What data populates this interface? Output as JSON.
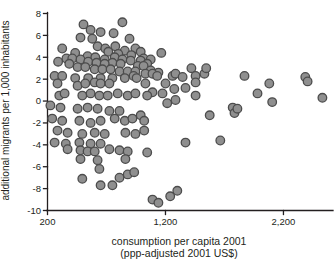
{
  "figure": {
    "background": "#ffffff",
    "axis_color": "#231f20",
    "text_color": "#231f20"
  },
  "chart_data": {
    "type": "scatter",
    "title": "",
    "xlabel": "consumption per capita 2001",
    "xlabel_line2": "(ppp-adjusted 2001 US$)",
    "ylabel": "additional migrants per 1,000 inhabitants",
    "xlim": [
      200,
      2620
    ],
    "ylim": [
      -10,
      8
    ],
    "grid": false,
    "legend": null,
    "xticks": {
      "values": [
        200,
        1200,
        2200
      ],
      "labels": [
        "200",
        "1,200",
        "2,200"
      ]
    },
    "yticks": {
      "values": [
        8,
        6,
        4,
        2,
        0,
        -2,
        -4,
        -6,
        -8,
        -10
      ],
      "labels": [
        "8",
        "6",
        "4",
        "2",
        "0",
        "-2",
        "-4",
        "-6",
        "-8",
        "-10"
      ]
    },
    "marker": {
      "fill": "#8f8f8f",
      "stroke": "#4c4c4c",
      "radius_px": 4.3,
      "stroke_width_px": 1.3
    },
    "points": [
      [
        505,
        7.0
      ],
      [
        835,
        7.2
      ],
      [
        565,
        6.5
      ],
      [
        650,
        6.3
      ],
      [
        760,
        6.2
      ],
      [
        480,
        5.8
      ],
      [
        580,
        5.7
      ],
      [
        895,
        5.7
      ],
      [
        625,
        5.0
      ],
      [
        775,
        5.0
      ],
      [
        325,
        4.8
      ],
      [
        690,
        4.8
      ],
      [
        945,
        4.8
      ],
      [
        855,
        4.6
      ],
      [
        990,
        4.5
      ],
      [
        435,
        4.4
      ],
      [
        715,
        4.5
      ],
      [
        800,
        4.3
      ],
      [
        910,
        4.2
      ],
      [
        540,
        4.1
      ],
      [
        605,
        4.0
      ],
      [
        770,
        4.0
      ],
      [
        1015,
        3.9
      ],
      [
        360,
        3.9
      ],
      [
        410,
        3.9
      ],
      [
        480,
        3.8
      ],
      [
        685,
        3.8
      ],
      [
        835,
        3.8
      ],
      [
        1075,
        3.8
      ],
      [
        905,
        3.7
      ],
      [
        990,
        3.7
      ],
      [
        290,
        3.6
      ],
      [
        545,
        3.6
      ],
      [
        615,
        3.5
      ],
      [
        750,
        3.5
      ],
      [
        385,
        3.4
      ],
      [
        685,
        3.4
      ],
      [
        820,
        3.4
      ],
      [
        1045,
        3.4
      ],
      [
        455,
        3.1
      ],
      [
        520,
        3.1
      ],
      [
        965,
        3.2
      ],
      [
        1015,
        3.2
      ],
      [
        600,
        2.9
      ],
      [
        665,
        2.9
      ],
      [
        735,
        2.9
      ],
      [
        810,
        2.7
      ],
      [
        880,
        2.7
      ],
      [
        945,
        2.7
      ],
      [
        1075,
        2.8
      ],
      [
        1140,
        2.6
      ],
      [
        260,
        2.3
      ],
      [
        325,
        2.3
      ],
      [
        930,
        2.3
      ],
      [
        435,
        2.1
      ],
      [
        545,
        2.1
      ],
      [
        650,
        2.1
      ],
      [
        750,
        2.1
      ],
      [
        855,
        2.1
      ],
      [
        955,
        2.1
      ],
      [
        1165,
        4.4
      ],
      [
        1030,
        2.5
      ],
      [
        1090,
        2.5
      ],
      [
        1130,
        2.3
      ],
      [
        1260,
        2.3
      ],
      [
        1285,
        2.5
      ],
      [
        1345,
        2.2
      ],
      [
        1420,
        3.0
      ],
      [
        1455,
        2.3
      ],
      [
        1530,
        2.5
      ],
      [
        1545,
        3.0
      ],
      [
        1870,
        2.3
      ],
      [
        2385,
        2.2
      ],
      [
        285,
        1.6
      ],
      [
        455,
        1.4
      ],
      [
        520,
        1.6
      ],
      [
        600,
        1.7
      ],
      [
        650,
        1.6
      ],
      [
        725,
        1.6
      ],
      [
        300,
        0.5
      ],
      [
        345,
        0.7
      ],
      [
        495,
        0.5
      ],
      [
        565,
        0.7
      ],
      [
        640,
        0.5
      ],
      [
        710,
        0.5
      ],
      [
        795,
        0.7
      ],
      [
        880,
        0.5
      ],
      [
        945,
        0.7
      ],
      [
        225,
        -0.4
      ],
      [
        310,
        -0.6
      ],
      [
        455,
        -0.7
      ],
      [
        540,
        -0.6
      ],
      [
        625,
        -0.7
      ],
      [
        725,
        -0.9
      ],
      [
        810,
        -0.9
      ],
      [
        240,
        -1.6
      ],
      [
        325,
        -1.8
      ],
      [
        470,
        -1.8
      ],
      [
        565,
        -2.0
      ],
      [
        650,
        -1.8
      ],
      [
        770,
        -1.6
      ],
      [
        855,
        -1.8
      ],
      [
        920,
        -1.6
      ],
      [
        990,
        -1.3
      ],
      [
        285,
        -2.7
      ],
      [
        370,
        -2.9
      ],
      [
        495,
        -3.0
      ],
      [
        600,
        -2.9
      ],
      [
        685,
        -3.0
      ],
      [
        860,
        -2.9
      ],
      [
        945,
        -3.0
      ],
      [
        260,
        -3.8
      ],
      [
        355,
        -3.9
      ],
      [
        470,
        -3.8
      ],
      [
        565,
        -3.9
      ],
      [
        650,
        -3.9
      ],
      [
        1030,
        1.6
      ],
      [
        1200,
        1.6
      ],
      [
        1455,
        1.7
      ],
      [
        1090,
        0.8
      ],
      [
        1275,
        1.1
      ],
      [
        1370,
        1.2
      ],
      [
        1045,
        0.5
      ],
      [
        1175,
        0.7
      ],
      [
        1455,
        0.5
      ],
      [
        1215,
        -0.2
      ],
      [
        1285,
        0.1
      ],
      [
        1770,
        -0.6
      ],
      [
        1575,
        -1.3
      ],
      [
        1785,
        -1.1
      ],
      [
        1020,
        -1.8
      ],
      [
        1020,
        -2.7
      ],
      [
        1370,
        -3.8
      ],
      [
        1665,
        -3.6
      ],
      [
        2080,
        1.6
      ],
      [
        2405,
        1.8
      ],
      [
        1980,
        0.7
      ],
      [
        2105,
        -0.1
      ],
      [
        2530,
        0.3
      ],
      [
        1810,
        -0.7
      ],
      [
        370,
        -4.4
      ],
      [
        480,
        -4.5
      ],
      [
        540,
        -4.6
      ],
      [
        600,
        -4.6
      ],
      [
        725,
        -4.4
      ],
      [
        810,
        -4.5
      ],
      [
        880,
        -4.6
      ],
      [
        480,
        -5.3
      ],
      [
        625,
        -5.4
      ],
      [
        860,
        -5.3
      ],
      [
        640,
        -6.2
      ],
      [
        495,
        -7.1
      ],
      [
        650,
        -7.7
      ],
      [
        750,
        -7.7
      ],
      [
        810,
        -7.0
      ],
      [
        880,
        -6.7
      ],
      [
        935,
        -6.5
      ],
      [
        1045,
        -4.7
      ],
      [
        1300,
        -8.2
      ],
      [
        1240,
        -8.7
      ],
      [
        1090,
        -9.0
      ],
      [
        1140,
        -9.3
      ]
    ]
  }
}
